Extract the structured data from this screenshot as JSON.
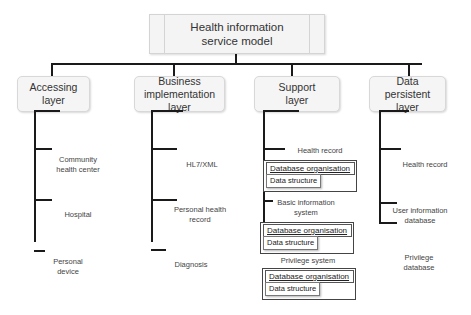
{
  "diagram": {
    "root": {
      "label": "Health information service model"
    },
    "layers": [
      {
        "label": "Accessing layer",
        "children": [
          "Community health center",
          "Hospital",
          "Personal device"
        ]
      },
      {
        "label": "Business implementation layer",
        "children": [
          "HL7/XML",
          "Personal health record",
          "Diagnosis"
        ]
      },
      {
        "label": "Support layer",
        "children": [
          {
            "label": "Health record",
            "db": "Database organisation",
            "ds": "Data structure"
          },
          {
            "label": "Basic information system",
            "db": "Database organisation",
            "ds": "Data structure"
          },
          {
            "label": "Privilege system",
            "db": "Database organisation",
            "ds": "Data structure"
          }
        ]
      },
      {
        "label": "Data persistent layer",
        "children": [
          "Health record",
          "User information database",
          "Privilege database"
        ]
      }
    ]
  }
}
